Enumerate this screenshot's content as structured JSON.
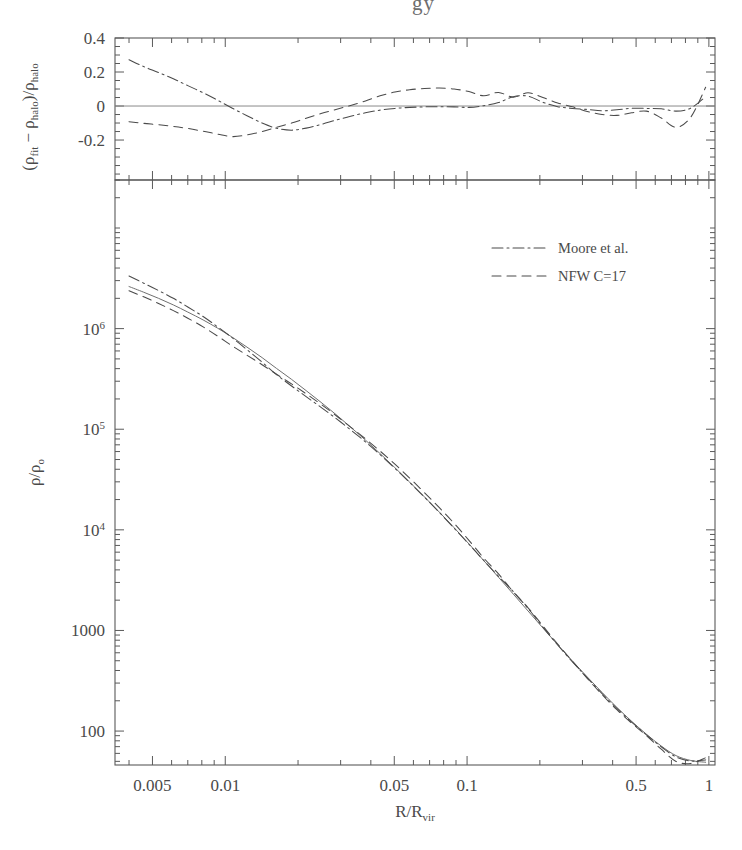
{
  "figure": {
    "header_fragment": "gy",
    "background_color": "#ffffff",
    "ink_color": "#4a4a4a"
  },
  "chart_data": {
    "type": "line",
    "title": "",
    "panels": [
      {
        "name": "residual-panel",
        "ylabel": "(ρ_fit − ρ_halo)/ρ_halo",
        "ylabel_parts": {
          "open": "(",
          "rho1": "ρ",
          "sub1": "fit",
          "minus": "−",
          "rho2": "ρ",
          "sub2": "halo",
          "close": ")/",
          "rho3": "ρ",
          "sub3": "halo"
        },
        "xlabel": "",
        "xscale": "log",
        "yscale": "linear",
        "xlim": [
          0.0035,
          1.06
        ],
        "ylim": [
          -0.435,
          0.4
        ],
        "yticks": [
          0.4,
          0.2,
          0,
          -0.2
        ],
        "yticklabels": [
          "0.4",
          "0.2",
          "0",
          "-0.2"
        ],
        "grid": false,
        "zero_reference_line": 0,
        "series": [
          {
            "name": "Moore et al.",
            "style": "dashdot",
            "x": [
              0.004,
              0.0046,
              0.0053,
              0.0061,
              0.007,
              0.0081,
              0.0093,
              0.0107,
              0.0123,
              0.0142,
              0.0163,
              0.0188,
              0.0216,
              0.0249,
              0.0287,
              0.033,
              0.038,
              0.0437,
              0.0503,
              0.0579,
              0.0667,
              0.0768,
              0.0884,
              0.1018,
              0.1172,
              0.1349,
              0.1553,
              0.1788,
              0.2058,
              0.237,
              0.2729,
              0.3141,
              0.3617,
              0.4164,
              0.4794,
              0.5519,
              0.6354,
              0.7315,
              0.8422,
              0.9697
            ],
            "y": [
              0.272,
              0.232,
              0.197,
              0.16,
              0.12,
              0.078,
              0.034,
              -0.013,
              -0.057,
              -0.1,
              -0.131,
              -0.142,
              -0.13,
              -0.108,
              -0.083,
              -0.06,
              -0.04,
              -0.024,
              -0.014,
              -0.008,
              -0.005,
              -0.004,
              -0.005,
              -0.008,
              0.002,
              0.02,
              0.055,
              0.058,
              0.022,
              -0.004,
              -0.014,
              -0.02,
              -0.028,
              -0.022,
              -0.013,
              -0.014,
              -0.016,
              -0.03,
              -0.012,
              0.055
            ]
          },
          {
            "name": "NFW C=17",
            "style": "dashed",
            "x": [
              0.004,
              0.0046,
              0.0053,
              0.0061,
              0.007,
              0.0081,
              0.0093,
              0.0107,
              0.0123,
              0.0142,
              0.0163,
              0.0188,
              0.0216,
              0.0249,
              0.0287,
              0.033,
              0.038,
              0.0437,
              0.0503,
              0.0579,
              0.0667,
              0.0768,
              0.0884,
              0.1018,
              0.1172,
              0.1349,
              0.1553,
              0.1788,
              0.2058,
              0.237,
              0.2729,
              0.3141,
              0.3617,
              0.4164,
              0.4794,
              0.5519,
              0.6354,
              0.7315,
              0.8422,
              0.9697
            ],
            "y": [
              -0.092,
              -0.102,
              -0.11,
              -0.12,
              -0.132,
              -0.148,
              -0.165,
              -0.18,
              -0.17,
              -0.15,
              -0.125,
              -0.1,
              -0.072,
              -0.044,
              -0.02,
              0.003,
              0.03,
              0.06,
              0.082,
              0.096,
              0.103,
              0.106,
              0.1,
              0.085,
              0.06,
              0.08,
              0.052,
              0.078,
              0.05,
              0.018,
              -0.005,
              -0.032,
              -0.05,
              -0.055,
              -0.04,
              -0.03,
              -0.07,
              -0.125,
              -0.065,
              0.11
            ]
          }
        ]
      },
      {
        "name": "density-profile-panel",
        "ylabel": "ρ/ρ_o",
        "ylabel_parts": {
          "rho1": "ρ",
          "slash": "/",
          "rho2": "ρ",
          "sub": "o"
        },
        "xlabel": "R/R_vir",
        "xlabel_parts": {
          "r1": "R",
          "slash": "/",
          "r2": "R",
          "sub": "vir"
        },
        "xscale": "log",
        "yscale": "log",
        "xlim": [
          0.0035,
          1.06
        ],
        "ylim": [
          46,
          30000000.0
        ],
        "xticks": [
          0.005,
          0.01,
          0.05,
          0.1,
          0.5,
          1
        ],
        "xticklabels": [
          "0.005",
          "0.01",
          "0.05",
          "0.1",
          "0.5",
          "1"
        ],
        "yticks": [
          1000000,
          100000,
          10000,
          1000,
          100
        ],
        "yticklabels": [
          "10^6",
          "10^5",
          "10^4",
          "1000",
          "100"
        ],
        "grid": false,
        "series": [
          {
            "name": "halo (simulation)",
            "style": "solid",
            "x": [
              0.004,
              0.0046,
              0.0053,
              0.0061,
              0.007,
              0.0081,
              0.0093,
              0.0107,
              0.0123,
              0.0142,
              0.0163,
              0.0188,
              0.0216,
              0.0249,
              0.0287,
              0.033,
              0.038,
              0.0437,
              0.0503,
              0.0579,
              0.0667,
              0.0768,
              0.0884,
              0.1018,
              0.1172,
              0.1349,
              0.1553,
              0.1788,
              0.2058,
              0.237,
              0.2729,
              0.3141,
              0.3617,
              0.4164,
              0.4794,
              0.5519,
              0.6354,
              0.7315,
              0.8422,
              0.9697
            ],
            "y": [
              2620000.0,
              2300000.0,
              2000000.0,
              1720000.0,
              1460000.0,
              1220000.0,
              1010000.0,
              820000.0,
              655000.0,
              515000.0,
              402000.0,
              313000.0,
              242000.0,
              185000.0,
              140000.0,
              105000.0,
              78000.0,
              57200.0,
              41500.0,
              29800.0,
              21200.0,
              15000.0,
              10500.0,
              7250.0,
              4950.0,
              3380.0,
              2300.0,
              1560.0,
              1060.0,
              720.0,
              495.0,
              345.0,
              242.0,
              172.0,
              125.0,
              93.0,
              71.0,
              57.0,
              51.0,
              49.0
            ]
          },
          {
            "name": "Moore et al.",
            "style": "dashdot",
            "x": [
              0.004,
              0.0046,
              0.0053,
              0.0061,
              0.007,
              0.0081,
              0.0093,
              0.0107,
              0.0123,
              0.0142,
              0.0163,
              0.0188,
              0.0216,
              0.0249,
              0.0287,
              0.033,
              0.038,
              0.0437,
              0.0503,
              0.0579,
              0.0667,
              0.0768,
              0.0884,
              0.1018,
              0.1172,
              0.1349,
              0.1553,
              0.1788,
              0.2058,
              0.237,
              0.2729,
              0.3141,
              0.3617,
              0.4164,
              0.4794,
              0.5519,
              0.6354,
              0.7315,
              0.8422,
              0.9697
            ],
            "y": [
              3330000.0,
              2830000.0,
              2390000.0,
              2000000.0,
              1640000.0,
              1320000.0,
              1040000.0,
              809000.0,
              618000.0,
              464000.0,
              349000.0,
              269000.0,
              211000.0,
              165000.0,
              128000.0,
              98700.0,
              74900.0,
              55800.0,
              40900.0,
              29600.0,
              21100.0,
              14900.0,
              10400.0,
              7190.0,
              4960.0,
              3450.0,
              2430.0,
              1650.0,
              1080.0,
              717.0,
              488.0,
              338.0,
              235.0,
              168.0,
              123.0,
              91.7,
              69.8,
              55.3,
              50.4,
              51.7
            ]
          },
          {
            "name": "NFW C=17",
            "style": "dashed",
            "x": [
              0.004,
              0.0046,
              0.0053,
              0.0061,
              0.007,
              0.0081,
              0.0093,
              0.0107,
              0.0123,
              0.0142,
              0.0163,
              0.0188,
              0.0216,
              0.0249,
              0.0287,
              0.033,
              0.038,
              0.0437,
              0.0503,
              0.0579,
              0.0667,
              0.0768,
              0.0884,
              0.1018,
              0.1172,
              0.1349,
              0.1553,
              0.1788,
              0.2058,
              0.237,
              0.2729,
              0.3141,
              0.3617,
              0.4164,
              0.4794,
              0.5519,
              0.6354,
              0.7315,
              0.8422,
              0.9697
            ],
            "y": [
              2380000.0,
              2070000.0,
              1780000.0,
              1510000.0,
              1270000.0,
              1040000.0,
              843000.0,
              672000.0,
              544000.0,
              438000.0,
              352000.0,
              282000.0,
              225000.0,
              177000.0,
              137000.0,
              105000.0,
              80300.0,
              60600.0,
              44900.0,
              32700.0,
              23400.0,
              16600.0,
              11600.0,
              7870.0,
              5250.0,
              3650.0,
              2420.0,
              1680.0,
              1110.0,
              733.0,
              493.0,
              334.0,
              230.0,
              163.0,
              120.0,
              90.2,
              66.0,
              49.9,
              47.7,
              54.4
            ]
          }
        ]
      }
    ],
    "legend": {
      "position": "upper-right-inside-main-panel",
      "entries": [
        {
          "label": "Moore et al.",
          "style": "dashdot"
        },
        {
          "label": "NFW C=17",
          "style": "dashed"
        }
      ]
    }
  }
}
